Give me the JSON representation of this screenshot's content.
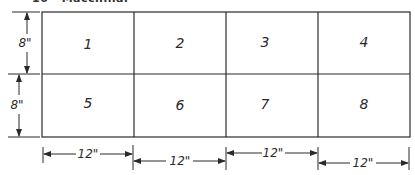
{
  "heading": {
    "text": "10 · Macchinal",
    "clipped": true
  },
  "grid": {
    "rows": 2,
    "cols": 4,
    "cells": [
      "1",
      "2",
      "3",
      "4",
      "5",
      "6",
      "7",
      "8"
    ]
  },
  "dimensions": {
    "left": [
      "8\"",
      "8\""
    ],
    "bottom": [
      "12\"",
      "12\"",
      "12\"",
      "12\""
    ]
  },
  "colors": {
    "line": "#2a2a2a",
    "background": "#ffffff"
  }
}
